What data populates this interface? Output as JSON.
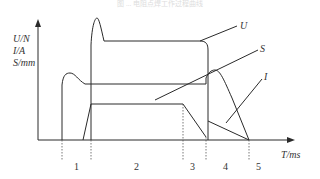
{
  "caption": "图 ... 电阻点焊工作过程曲线",
  "axes": {
    "y_labels": [
      "U/N",
      "I/A",
      "S/mm"
    ],
    "x_label": "T/ms"
  },
  "curves": {
    "U": "U",
    "S": "S",
    "I": "I"
  },
  "phases": [
    "1",
    "2",
    "3",
    "4",
    "5"
  ],
  "colors": {
    "line": "#2a2a2a",
    "text": "#333333"
  }
}
